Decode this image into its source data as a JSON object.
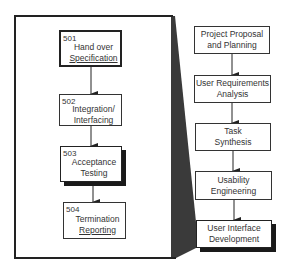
{
  "diagram": {
    "detail_steps": [
      {
        "number": "501",
        "label_lines": [
          "Hand over",
          "Specification"
        ],
        "emphasis": "bold-border"
      },
      {
        "number": "502",
        "label_lines": [
          "Integration/",
          "Interfacing"
        ],
        "emphasis": "none"
      },
      {
        "number": "503",
        "label_lines": [
          "Acceptance",
          "Testing"
        ],
        "emphasis": "drop-shadow"
      },
      {
        "number": "504",
        "label_lines": [
          "Termination",
          "Reporting"
        ],
        "emphasis": "none"
      }
    ],
    "phases": [
      {
        "label_lines": [
          "Project Proposal",
          "and Planning"
        ],
        "emphasis": "none"
      },
      {
        "label_lines": [
          "User Requirements",
          "Analysis"
        ],
        "emphasis": "none"
      },
      {
        "label_lines": [
          "Task",
          "Synthesis"
        ],
        "emphasis": "none"
      },
      {
        "label_lines": [
          "Usability",
          "Engineering"
        ],
        "emphasis": "none"
      },
      {
        "label_lines": [
          "User Interface",
          "Development"
        ],
        "emphasis": "drop-shadow",
        "expanded": true
      }
    ],
    "colors": {
      "line": "#222222",
      "wedge": "#3a3a3a",
      "background": "#ffffff"
    }
  }
}
